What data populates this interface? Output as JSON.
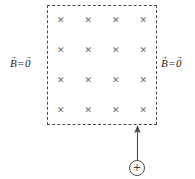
{
  "figure": {
    "background_color": "#ffffff",
    "width": 195,
    "height": 179
  },
  "field_region": {
    "name": "uniform-magnetic-field-region",
    "boundary_style": "dashed",
    "boundary_color": "#4a4a4a",
    "field_direction": "into-page",
    "marker_glyph": "✕",
    "marker_color": "#6b6b6b",
    "grid_rows": 4,
    "grid_cols": 4,
    "marker_count": 16
  },
  "labels": {
    "left": {
      "symbol": "B",
      "equals": "=",
      "value": "0",
      "full_text": "B⃗ = 0⃗"
    },
    "right": {
      "symbol": "B",
      "equals": "=",
      "value": "0",
      "full_text": "B⃗ = 0⃗"
    }
  },
  "charge": {
    "sign": "+",
    "polarity": "positive",
    "outline_color": "#4a4a4a"
  },
  "velocity_arrow": {
    "direction": "up",
    "stroke_color": "#4a4a4a",
    "points_to": "field-region-bottom-edge"
  }
}
